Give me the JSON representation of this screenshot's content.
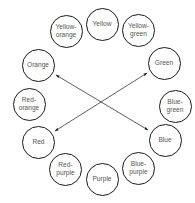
{
  "diagram": {
    "nodes": [
      {
        "id": "yellow",
        "label": "Yellow",
        "cx": 102,
        "cy": 24,
        "r": 16.5
      },
      {
        "id": "yellow-green",
        "label": "Yellow-\ngreen",
        "cx": 138.5,
        "cy": 30,
        "r": 16.5
      },
      {
        "id": "green",
        "label": "Green",
        "cx": 164,
        "cy": 63,
        "r": 16.5
      },
      {
        "id": "blue-green",
        "label": "Blue-\ngreen",
        "cx": 175,
        "cy": 106,
        "r": 16.5
      },
      {
        "id": "blue",
        "label": "Blue",
        "cx": 165,
        "cy": 140,
        "r": 16.5
      },
      {
        "id": "blue-purple",
        "label": "Blue-\npurple",
        "cx": 138.5,
        "cy": 168,
        "r": 16.5
      },
      {
        "id": "purple",
        "label": "Purple",
        "cx": 102,
        "cy": 179,
        "r": 16.5
      },
      {
        "id": "red-purple",
        "label": "Red-\npurple",
        "cx": 65.5,
        "cy": 169,
        "r": 16.5
      },
      {
        "id": "red",
        "label": "Red",
        "cx": 38.5,
        "cy": 142,
        "r": 16.5
      },
      {
        "id": "red-orange",
        "label": "Red-\norange",
        "cx": 29,
        "cy": 104,
        "r": 16.5
      },
      {
        "id": "orange",
        "label": "Orange",
        "cx": 38,
        "cy": 65,
        "r": 16.5
      },
      {
        "id": "yellow-orange",
        "label": "Yellow-\norange",
        "cx": 66,
        "cy": 31,
        "r": 16.5
      }
    ],
    "arrows": [
      {
        "from": "orange",
        "to": "blue",
        "x1": 56,
        "y1": 75,
        "x2": 148,
        "y2": 130,
        "double_headed": true
      },
      {
        "from": "green",
        "to": "red",
        "x1": 147,
        "y1": 73,
        "x2": 55,
        "y2": 131,
        "double_headed": true
      }
    ],
    "colors": {
      "stroke": "#1a1a1a",
      "label": "#555555",
      "arrow": "#333333",
      "background": "#ffffff"
    }
  }
}
